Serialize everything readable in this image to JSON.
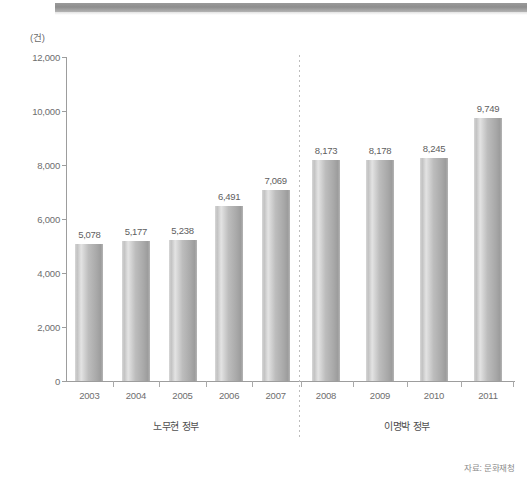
{
  "chart_data": {
    "type": "bar",
    "title": "",
    "unit_label": "(건)",
    "xlabel": "",
    "ylabel": "",
    "categories": [
      "2003",
      "2004",
      "2005",
      "2006",
      "2007",
      "2008",
      "2009",
      "2010",
      "2011"
    ],
    "values": [
      5078,
      5177,
      5238,
      6491,
      7069,
      8173,
      8178,
      8245,
      9749
    ],
    "value_labels": [
      "5,078",
      "5,177",
      "5,238",
      "6,491",
      "7,069",
      "8,173",
      "8,178",
      "8,245",
      "9,749"
    ],
    "ylim": [
      0,
      12000
    ],
    "ytick_values": [
      0,
      2000,
      4000,
      6000,
      8000,
      10000,
      12000
    ],
    "ytick_labels": [
      "0",
      "2,000",
      "4,000",
      "6,000",
      "8,000",
      "10,000",
      "12,000"
    ],
    "grid": false,
    "legend": null,
    "bar_color": "#b9b9b9",
    "axis_color": "#9d9d9d",
    "groups": [
      {
        "caption": "노무현 정부",
        "categories": [
          "2003",
          "2004",
          "2005",
          "2006",
          "2007"
        ]
      },
      {
        "caption": "이명박 정부",
        "categories": [
          "2008",
          "2009",
          "2010",
          "2011"
        ]
      }
    ],
    "divider_after_category": "2007",
    "source": "자료: 문화재청"
  }
}
